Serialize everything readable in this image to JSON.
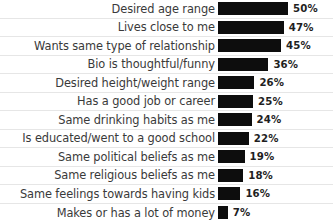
{
  "chart_data": {
    "type": "bar",
    "title": "",
    "xlabel": "",
    "ylabel": "",
    "orientation": "horizontal",
    "grid": false,
    "legend": null,
    "xlim": [
      0,
      50
    ],
    "value_suffix": "%",
    "bar_color": "#0d0d0d",
    "label_color": "#3a3a3a",
    "separator_color": "#e6e6e6",
    "categories": [
      "Desired age range",
      "Lives close to me",
      "Wants same type of relationship",
      "Bio is thoughtful/funny",
      "Desired height/weight range",
      "Has a good job or career",
      "Same drinking habits as me",
      "Is educated/went to a good school",
      "Same political beliefs as me",
      "Same religious beliefs as me",
      "Same feelings towards having kids",
      "Makes or has a lot of money"
    ],
    "values": [
      50,
      47,
      45,
      36,
      26,
      25,
      24,
      22,
      19,
      18,
      16,
      7
    ],
    "value_labels": [
      "50%",
      "47%",
      "45%",
      "36%",
      "26%",
      "25%",
      "24%",
      "22%",
      "19%",
      "18%",
      "16%",
      "7%"
    ],
    "rows": [
      {
        "label": "Desired age range",
        "value": 50,
        "value_label": "50%"
      },
      {
        "label": "Lives close to me",
        "value": 47,
        "value_label": "47%"
      },
      {
        "label": "Wants same type of relationship",
        "value": 45,
        "value_label": "45%"
      },
      {
        "label": "Bio is thoughtful/funny",
        "value": 36,
        "value_label": "36%"
      },
      {
        "label": "Desired height/weight range",
        "value": 26,
        "value_label": "26%"
      },
      {
        "label": "Has a good job or career",
        "value": 25,
        "value_label": "25%"
      },
      {
        "label": "Same drinking habits as me",
        "value": 24,
        "value_label": "24%"
      },
      {
        "label": "Is educated/went to a good school",
        "value": 22,
        "value_label": "22%"
      },
      {
        "label": "Same political beliefs as me",
        "value": 19,
        "value_label": "19%"
      },
      {
        "label": "Same religious beliefs as me",
        "value": 18,
        "value_label": "18%"
      },
      {
        "label": "Same feelings towards having kids",
        "value": 16,
        "value_label": "16%"
      },
      {
        "label": "Makes or has a lot of money",
        "value": 7,
        "value_label": "7%"
      }
    ]
  }
}
